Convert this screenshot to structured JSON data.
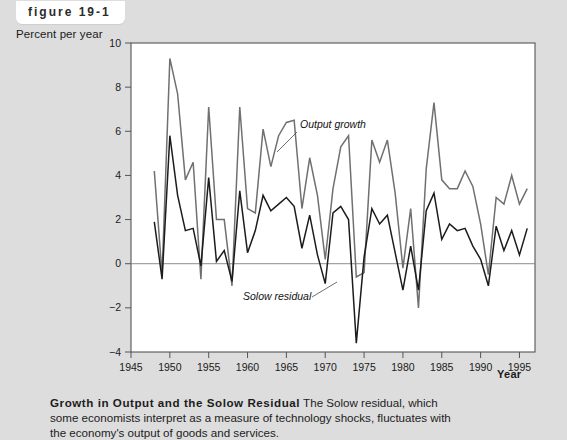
{
  "figure": {
    "tag_label": "figure 19-1",
    "y_axis_title": "Percent per year",
    "x_axis_title": "Year"
  },
  "caption": {
    "title": "Growth in Output and the Solow Residual",
    "line1": " The Solow residual, which",
    "line2": "some economists interpret as a measure of technology shocks, fluctuates with",
    "line3": "the economy's output of goods and services."
  },
  "annotations": {
    "output_growth": "Output growth",
    "solow_residual": "Solow residual"
  },
  "colors": {
    "page_background": "#dddddd",
    "panel_background": "#ffffff",
    "output_growth_line": "#707070",
    "solow_residual_line": "#1c1c1c",
    "zero_line": "#8c8c8c",
    "axis": "#555555"
  },
  "chart_data": {
    "type": "line",
    "title": "Growth in Output and the Solow Residual",
    "xlabel": "Year",
    "ylabel": "Percent per year",
    "xlim": [
      1945,
      1997
    ],
    "ylim": [
      -4,
      10
    ],
    "xticks": [
      1945,
      1950,
      1955,
      1960,
      1965,
      1970,
      1975,
      1980,
      1985,
      1990,
      1995
    ],
    "yticks": [
      -4,
      -2,
      0,
      2,
      4,
      6,
      8,
      10
    ],
    "grid": false,
    "zero_line": 0,
    "legend_position": "inline-annotations",
    "x": [
      1948,
      1949,
      1950,
      1951,
      1952,
      1953,
      1954,
      1955,
      1956,
      1957,
      1958,
      1959,
      1960,
      1961,
      1962,
      1963,
      1964,
      1965,
      1966,
      1967,
      1968,
      1969,
      1970,
      1971,
      1972,
      1973,
      1974,
      1975,
      1976,
      1977,
      1978,
      1979,
      1980,
      1981,
      1982,
      1983,
      1984,
      1985,
      1986,
      1987,
      1988,
      1989,
      1990,
      1991,
      1992,
      1993,
      1994,
      1995,
      1996
    ],
    "series": [
      {
        "name": "Output growth",
        "color": "#707070",
        "values": [
          4.2,
          -0.5,
          9.3,
          7.7,
          3.8,
          4.6,
          -0.7,
          7.1,
          2.0,
          2.0,
          -1.0,
          7.1,
          2.5,
          2.3,
          6.1,
          4.4,
          5.8,
          6.4,
          6.5,
          2.5,
          4.8,
          3.1,
          0.2,
          3.4,
          5.3,
          5.8,
          -0.6,
          -0.4,
          5.6,
          4.6,
          5.6,
          3.2,
          -0.2,
          2.5,
          -2.0,
          4.3,
          7.3,
          3.8,
          3.4,
          3.4,
          4.2,
          3.5,
          1.8,
          -0.5,
          3.0,
          2.7,
          4.0,
          2.7,
          3.4
        ]
      },
      {
        "name": "Solow residual",
        "color": "#1c1c1c",
        "values": [
          1.9,
          -0.7,
          5.8,
          3.1,
          1.5,
          1.6,
          -0.1,
          3.9,
          0.1,
          0.6,
          -0.8,
          3.3,
          0.5,
          1.5,
          3.1,
          2.4,
          2.7,
          3.0,
          2.6,
          0.7,
          2.2,
          0.4,
          -0.9,
          2.3,
          2.6,
          2.0,
          -3.6,
          0.3,
          2.5,
          1.8,
          2.2,
          0.5,
          -1.2,
          0.8,
          -1.2,
          2.4,
          3.2,
          1.1,
          1.8,
          1.5,
          1.6,
          0.8,
          0.2,
          -1.0,
          1.7,
          0.6,
          1.5,
          0.4,
          1.6
        ]
      }
    ]
  }
}
